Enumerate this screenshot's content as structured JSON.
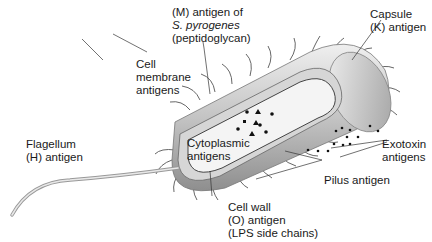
{
  "labels": {
    "m_antigen": {
      "line1": "(M) antigen of",
      "line2": "S. pyrogenes",
      "line3": "(peptidoglycan)"
    },
    "capsule": {
      "line1": "Capsule",
      "line2": "(K) antigen"
    },
    "cell_membrane": {
      "line1": "Cell",
      "line2": "membrane",
      "line3": "antigens"
    },
    "cytoplasmic": {
      "line1": "Cytoplasmic",
      "line2": "antigens"
    },
    "exotoxin": {
      "line1": "Exotoxin",
      "line2": "antigens"
    },
    "flagellum": {
      "line1": "Flagellum",
      "line2": "(H) antigen"
    },
    "pilus": {
      "line1": "Pilus antigen"
    },
    "cell_wall": {
      "line1": "Cell wall",
      "line2": "(O) antigen",
      "line3": "(LPS side chains)"
    }
  },
  "colors": {
    "body_light": "#e6e6e6",
    "body_mid": "#b8b8b8",
    "body_dark": "#8c8c8c",
    "line": "#333333"
  }
}
